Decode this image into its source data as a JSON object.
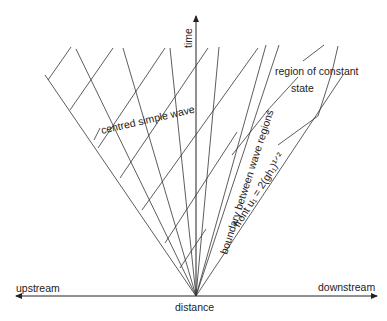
{
  "diagram": {
    "axes": {
      "vertical_label": "time",
      "horizontal_label": "distance",
      "left_label": "upstream",
      "right_label": "downstream"
    },
    "annotations": {
      "fan": "centred simple wave",
      "boundary": "boundary between wave regions",
      "constant_region_line1": "region of constant",
      "constant_region_line2": "state",
      "front": "front u₁ = 2(gh₁)¹ᐟ²"
    },
    "colors": {
      "line": "#333333",
      "background": "#ffffff"
    }
  }
}
